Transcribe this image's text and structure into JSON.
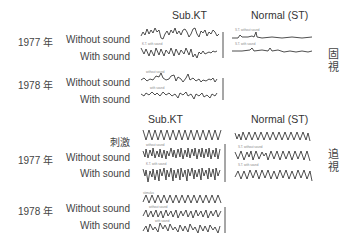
{
  "sections": {
    "fixation": {
      "label": "固視",
      "col_headers": [
        "Sub.KT",
        "Normal (ST)"
      ],
      "rows": [
        {
          "year": "1977 年",
          "condition": "Without sound"
        },
        {
          "condition": "With sound"
        },
        {
          "year": "1978 年",
          "condition": "Without sound"
        },
        {
          "condition": "With sound"
        }
      ]
    },
    "pursuit": {
      "label": "追視",
      "col_headers": [
        "Sub.KT",
        "Normal (ST)"
      ],
      "stimulus_label": "刺激",
      "rows": [
        {
          "year": "1977 年",
          "condition": "Without sound"
        },
        {
          "condition": "With sound"
        },
        {
          "year": "1978 年",
          "condition": "Without sound"
        },
        {
          "condition": "With sound"
        }
      ]
    }
  },
  "trace_annotations": {
    "kt_with_sound": "K.T. with sound",
    "st_without_sound": "S.T. without sound",
    "st_with_sound": "S.T. with sound",
    "without_sound": "without sound",
    "with_sound": "with sound",
    "stimulus": "stimulus"
  },
  "colors": {
    "ink": "#222222",
    "text": "#444444",
    "background": "#ffffff"
  }
}
